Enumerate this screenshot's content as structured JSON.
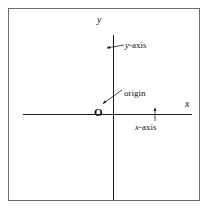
{
  "figure": {
    "kind": "cartesian-coordinate-plane-diagram",
    "width": 207,
    "height": 211,
    "background_color": "#fdfdfb",
    "plate_background_color": "#ffffff",
    "frame_color": "#6b6b6b",
    "ink_color": "#1a1a1a"
  },
  "axes": {
    "y_letter": "y",
    "x_letter": "x",
    "origin_letter": "O",
    "vertical_axis": {
      "x": 104,
      "y_top": 26,
      "y_bottom": 191
    },
    "horizontal_axis": {
      "y": 105,
      "x_left": 14,
      "x_right": 183
    },
    "origin_point": {
      "x": 104,
      "y": 105
    }
  },
  "annotations": [
    {
      "id": "y-axis",
      "text": "y-axis",
      "italic_prefix": "y",
      "rest": "-axis",
      "label_x": 125,
      "label_y": 41,
      "leader_from": {
        "x": 124,
        "y": 45
      },
      "leader_to": {
        "x": 106,
        "y": 48
      },
      "arrow": "at-target"
    },
    {
      "id": "origin",
      "text": "origin",
      "italic_prefix": "",
      "rest": "origin",
      "label_x": 124,
      "label_y": 89,
      "leader_from": {
        "x": 122,
        "y": 90
      },
      "leader_to": {
        "x": 102,
        "y": 104
      },
      "arrow": "at-target"
    },
    {
      "id": "x-axis",
      "text": "x-axis",
      "italic_prefix": "x",
      "rest": "-axis",
      "label_x": 135,
      "label_y": 123,
      "leader_from": {
        "x": 155,
        "y": 121
      },
      "leader_to": {
        "x": 155,
        "y": 108
      },
      "arrow": "at-target"
    }
  ]
}
